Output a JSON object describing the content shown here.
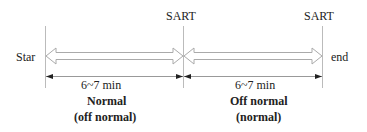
{
  "diagram": {
    "start_label": "Star",
    "end_label": "end",
    "markers": [
      {
        "label": "SART",
        "x": 183
      },
      {
        "label": "SART",
        "x": 322
      }
    ],
    "segments": [
      {
        "duration": "6~7 min",
        "state": "Normal",
        "alt_state": "(off normal)"
      },
      {
        "duration": "6~7 min",
        "state": "Off normal",
        "alt_state": "(normal)"
      }
    ],
    "colors": {
      "line": "#aaaaaa",
      "arrow": "#222222",
      "text": "#222222"
    }
  }
}
